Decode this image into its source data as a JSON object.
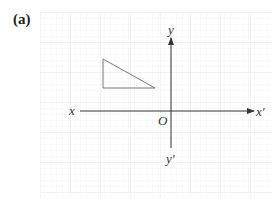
{
  "panel": {
    "label": "(a)"
  },
  "axes": {
    "x_label": "x",
    "x_prime_label": "x′",
    "y_label": "y",
    "y_prime_label": "y′",
    "origin_label": "O"
  },
  "colors": {
    "grid": "#eeeeee",
    "grid_major": "#e2e2e2",
    "axis": "#333333",
    "triangle": "#666666"
  },
  "shape": {
    "type": "right-triangle",
    "vertices_px": [
      [
        103,
        59
      ],
      [
        103,
        88
      ],
      [
        155,
        88
      ]
    ]
  }
}
